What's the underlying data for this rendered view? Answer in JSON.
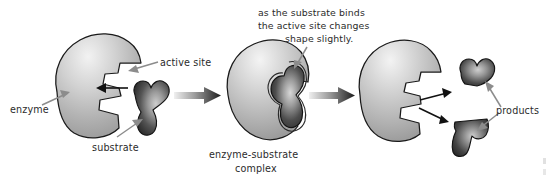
{
  "diagram": {
    "background_color": "#ffffff",
    "stages": [
      {
        "id": "stage-1",
        "name": "enzyme and substrate separate",
        "labels": [
          "enzyme",
          "active site",
          "substrate"
        ]
      },
      {
        "id": "stage-2",
        "name": "enzyme-substrate complex",
        "labels": [
          "enzyme-substrate complex"
        ]
      },
      {
        "id": "stage-3",
        "name": "products released",
        "labels": [
          "products"
        ]
      }
    ]
  },
  "labels": {
    "enzyme": "enzyme",
    "active_site": "active site",
    "substrate": "substrate",
    "complex_line1": "enzyme-substrate",
    "complex_line2": "complex",
    "products": "products"
  },
  "caption": {
    "line1": "as the substrate binds",
    "line2": "the active site changes",
    "line3": "shape slightly."
  },
  "colors": {
    "enzyme_light": "#e8e8e8",
    "enzyme_mid": "#bcbcbc",
    "enzyme_dark": "#8f8f8f",
    "substrate_light": "#b9b9b9",
    "substrate_dark": "#2e2e2e",
    "outline": "#1a1a1a",
    "text": "#2b2b2b",
    "leader": "#8c8c8c",
    "arrow_black": "#111111"
  }
}
